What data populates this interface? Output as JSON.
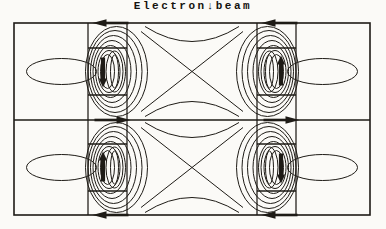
{
  "figure": {
    "title": "Electron↓beam"
  },
  "diagram": {
    "line_color": "#1e1b16",
    "background_color": "#fbfaf7",
    "border_arrows": [
      {
        "position": "top-left-channel",
        "direction": "left"
      },
      {
        "position": "top-right-channel",
        "direction": "left"
      },
      {
        "position": "middle-left-channel",
        "direction": "right"
      },
      {
        "position": "middle-right-channel",
        "direction": "right"
      },
      {
        "position": "bottom-left-channel",
        "direction": "left"
      },
      {
        "position": "bottom-right-channel",
        "direction": "left"
      }
    ],
    "channel_arrows": [
      {
        "cell": "upper-left",
        "direction": "down"
      },
      {
        "cell": "upper-right",
        "direction": "up"
      },
      {
        "cell": "lower-left",
        "direction": "up"
      },
      {
        "cell": "lower-right",
        "direction": "down"
      }
    ]
  }
}
